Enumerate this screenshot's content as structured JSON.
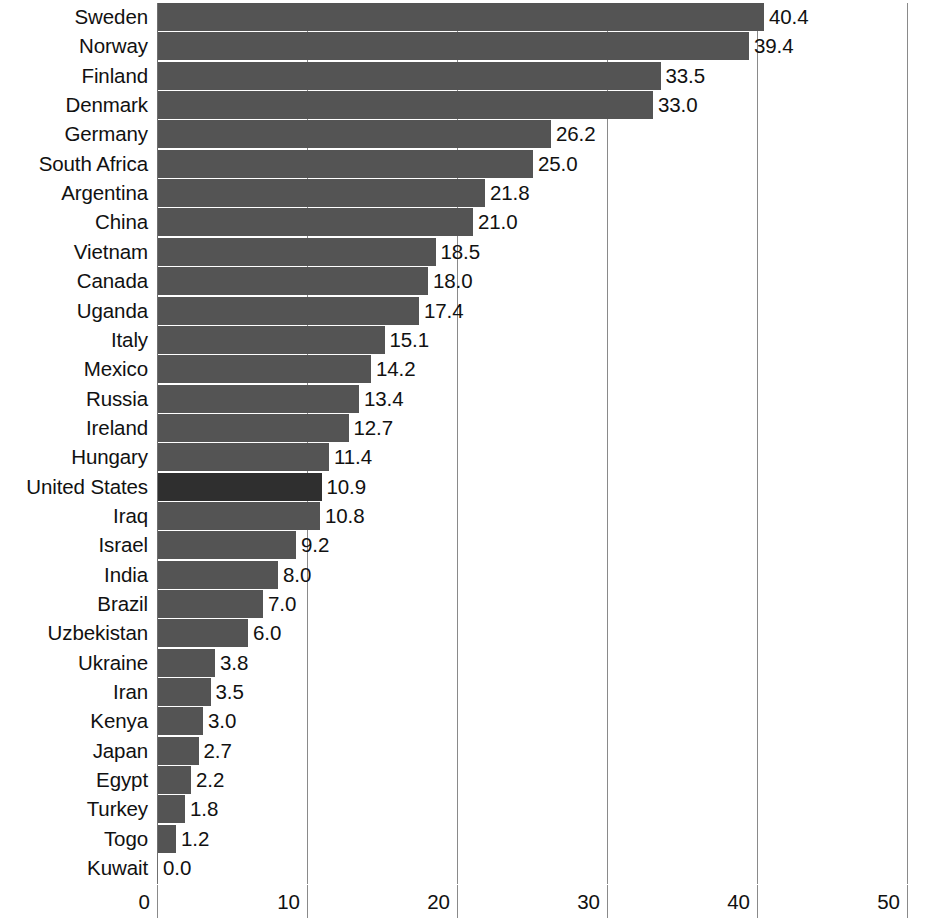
{
  "chart_data": {
    "type": "bar",
    "orientation": "horizontal",
    "title": "",
    "subtitle": "",
    "xlabel": "",
    "ylabel": "",
    "xlim": [
      0,
      50
    ],
    "ylim": null,
    "grid": "vertical gridlines at each x tick",
    "legend": null,
    "xticks": [
      "0",
      "10",
      "20",
      "30",
      "40",
      "50"
    ],
    "xtick_values": [
      0,
      10,
      20,
      30,
      40,
      50
    ],
    "highlight_category": "United States",
    "categories": [
      "Sweden",
      "Norway",
      "Finland",
      "Denmark",
      "Germany",
      "South Africa",
      "Argentina",
      "China",
      "Vietnam",
      "Canada",
      "Uganda",
      "Italy",
      "Mexico",
      "Russia",
      "Ireland",
      "Hungary",
      "United States",
      "Iraq",
      "Israel",
      "India",
      "Brazil",
      "Uzbekistan",
      "Ukraine",
      "Iran",
      "Kenya",
      "Japan",
      "Egypt",
      "Turkey",
      "Togo",
      "Kuwait"
    ],
    "values": [
      40.4,
      39.4,
      33.5,
      33.0,
      26.2,
      25.0,
      21.8,
      21.0,
      18.5,
      18.0,
      17.4,
      15.1,
      14.2,
      13.4,
      12.7,
      11.4,
      10.9,
      10.8,
      9.2,
      8.0,
      7.0,
      6.0,
      3.8,
      3.5,
      3.0,
      2.7,
      2.2,
      1.8,
      1.2,
      0.0
    ],
    "value_labels": [
      "40.4",
      "39.4",
      "33.5",
      "33.0",
      "26.2",
      "25.0",
      "21.8",
      "21.0",
      "18.5",
      "18.0",
      "17.4",
      "15.1",
      "14.2",
      "13.4",
      "12.7",
      "11.4",
      "10.9",
      "10.8",
      "9.2",
      "8.0",
      "7.0",
      "6.0",
      "3.8",
      "3.5",
      "3.0",
      "2.7",
      "2.2",
      "1.8",
      "1.2",
      "0.0"
    ],
    "colors": {
      "bar": "#545454",
      "bar_highlight": "#2f2f2f",
      "gridline": "#8a8a8a",
      "text": "#111111",
      "background": "#ffffff"
    }
  }
}
